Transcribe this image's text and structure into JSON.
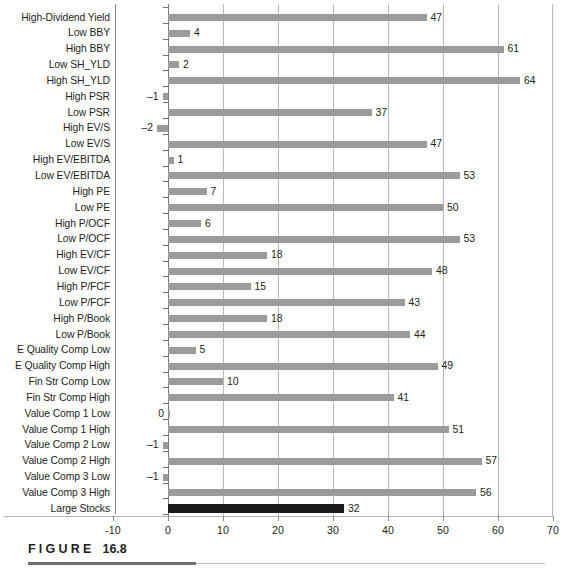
{
  "figure": {
    "caption_word": "FIGURE",
    "caption_number": "16.8"
  },
  "chart_data": {
    "type": "bar",
    "orientation": "horizontal",
    "title": "",
    "xlabel": "",
    "ylabel": "",
    "xlim": [
      -10,
      70
    ],
    "xticks": [
      -10,
      0,
      10,
      20,
      30,
      40,
      50,
      60,
      70
    ],
    "xtick_labels": [
      "-10",
      "0",
      "10",
      "20",
      "30",
      "40",
      "50",
      "60",
      "70"
    ],
    "grid": true,
    "grid_axis": "x",
    "legend": false,
    "bar_color": "#9b9b9b",
    "highlight_color": "#1a1a1a",
    "highlight_category": "Large Stocks",
    "categories": [
      "High-Dividend Yield",
      "Low BBY",
      "High BBY",
      "Low SH_YLD",
      "High SH_YLD",
      "High PSR",
      "Low PSR",
      "High EV/S",
      "Low EV/S",
      "High EV/EBITDA",
      "Low EV/EBITDA",
      "High PE",
      "Low PE",
      "High P/OCF",
      "Low P/OCF",
      "High EV/CF",
      "Low EV/CF",
      "High P/FCF",
      "Low P/FCF",
      "High P/Book",
      "Low P/Book",
      "E Quality Comp Low",
      "E Quality Comp High",
      "Fin Str Comp Low",
      "Fin Str Comp High",
      "Value Comp 1 Low",
      "Value Comp 1 High",
      "Value Comp 2 Low",
      "Value Comp 2 High",
      "Value Comp 3 Low",
      "Value Comp 3 High",
      "Large Stocks"
    ],
    "values": [
      47,
      4,
      61,
      2,
      64,
      -1,
      37,
      -2,
      47,
      1,
      53,
      7,
      50,
      6,
      53,
      18,
      48,
      15,
      43,
      18,
      44,
      5,
      49,
      10,
      41,
      0,
      51,
      -1,
      57,
      -1,
      56,
      32
    ],
    "value_labels": [
      "47",
      "4",
      "61",
      "2",
      "64",
      "–1",
      "37",
      "–2",
      "47",
      "1",
      "53",
      "7",
      "50",
      "6",
      "53",
      "18",
      "48",
      "15",
      "43",
      "18",
      "44",
      "5",
      "49",
      "10",
      "41",
      "0",
      "51",
      "–1",
      "57",
      "–1",
      "56",
      "32"
    ]
  }
}
